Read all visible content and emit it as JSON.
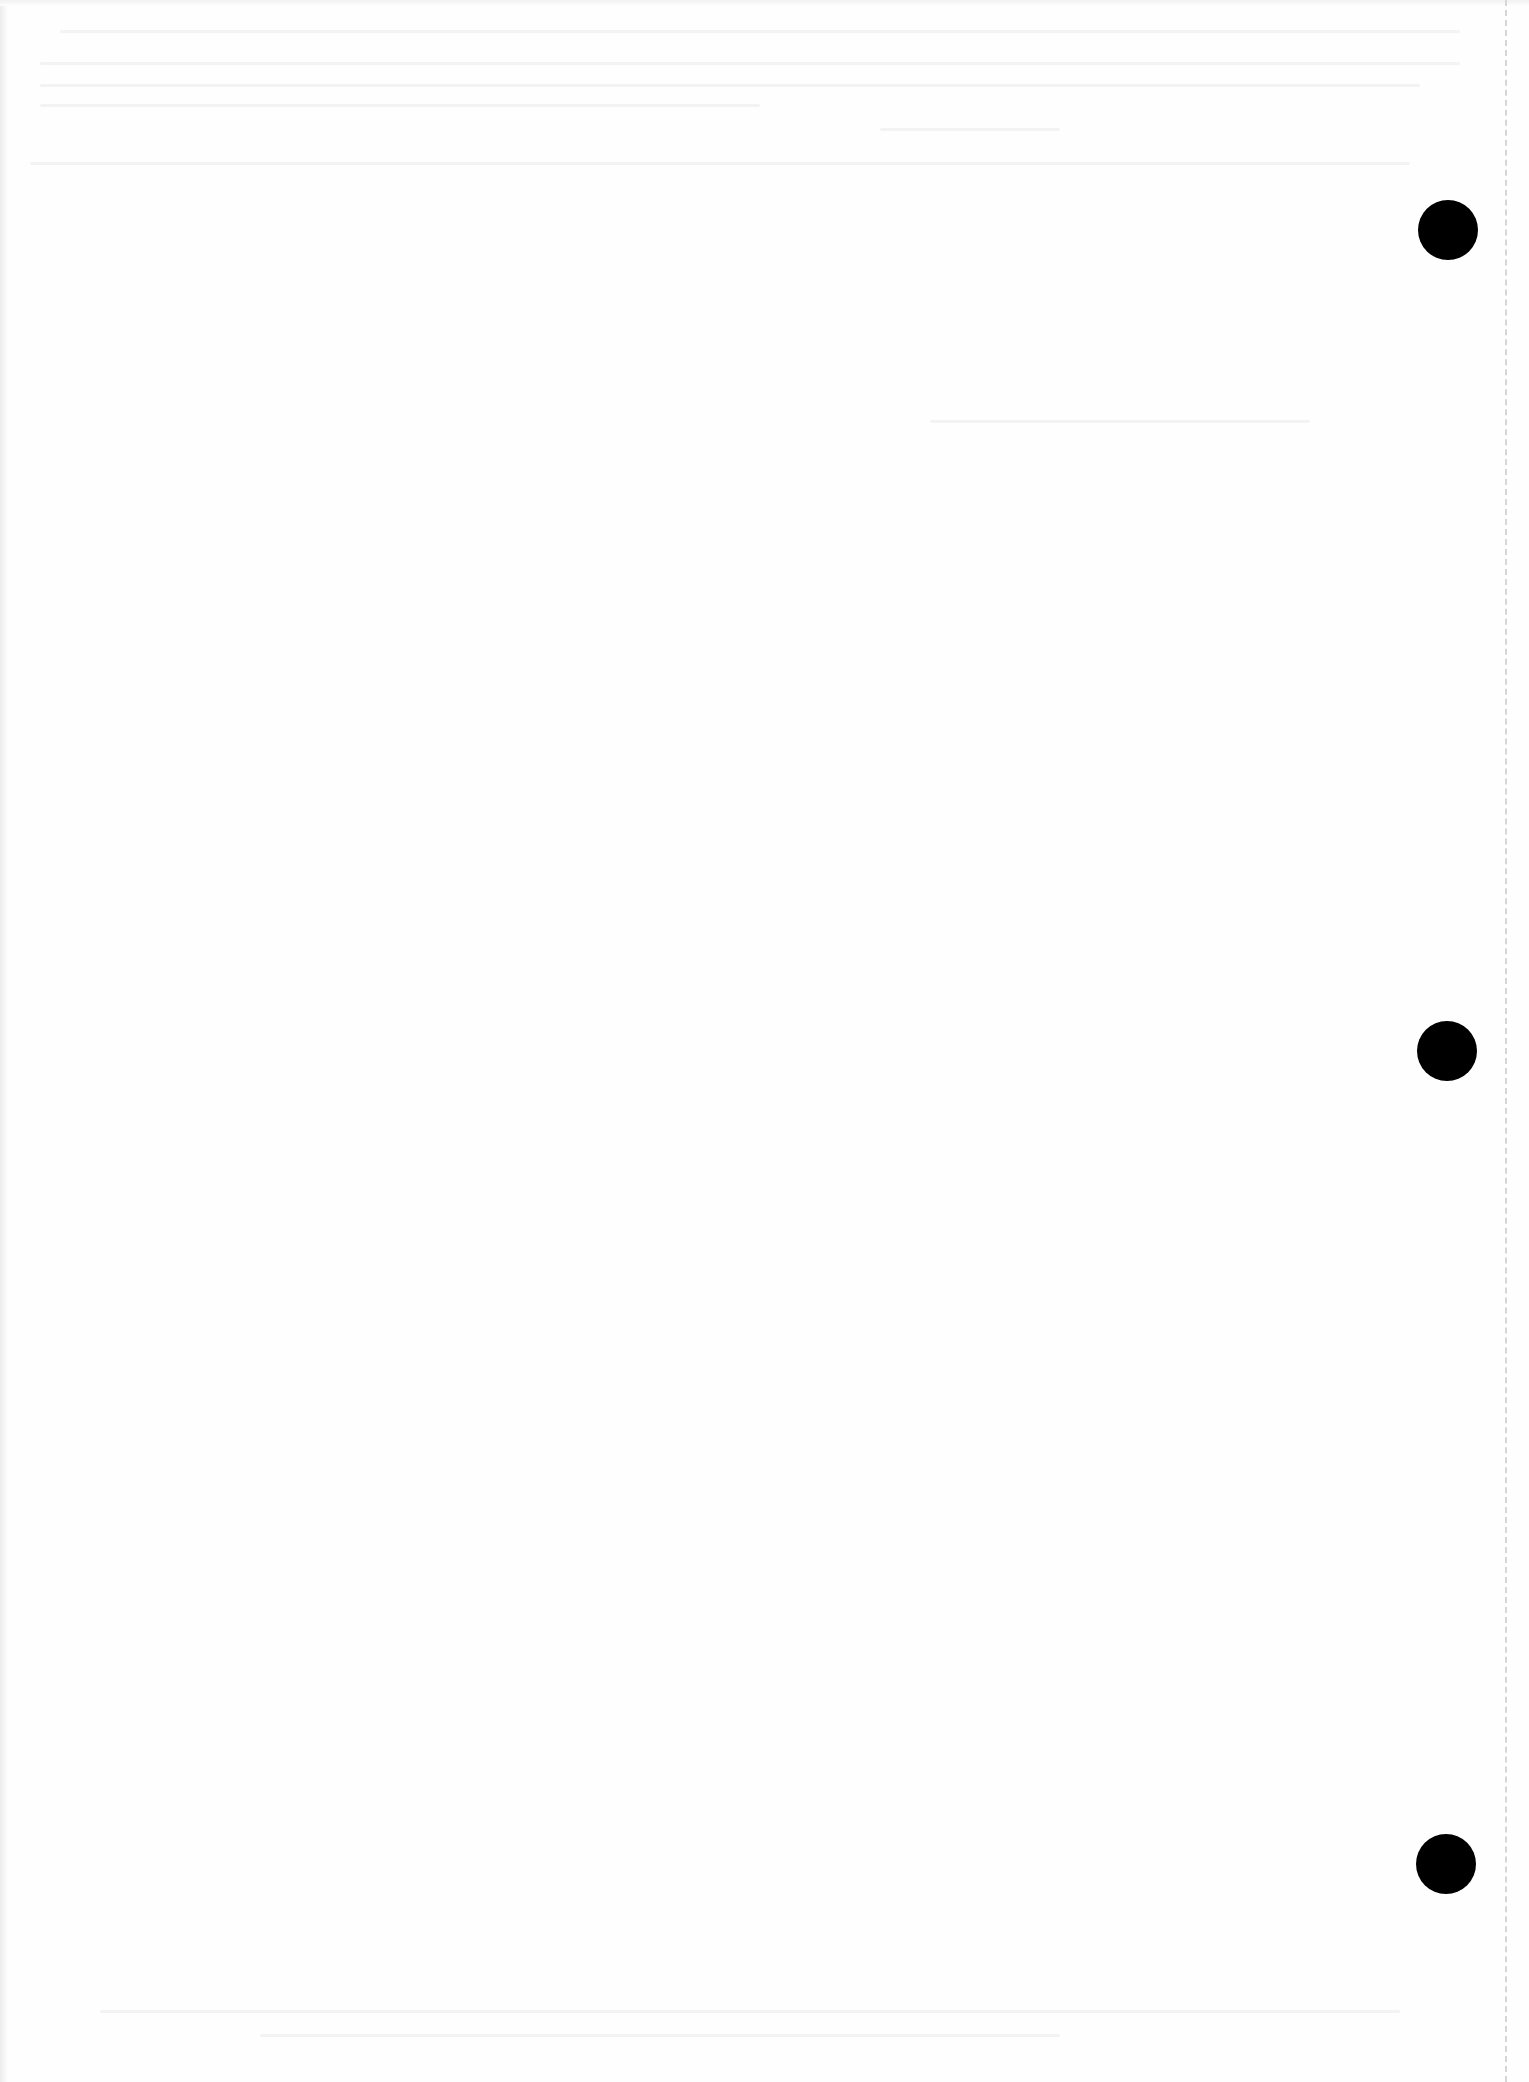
{
  "document": {
    "type": "scanned blank page",
    "background_color": "#fefefe",
    "punch_holes": [
      {
        "cx": 1448,
        "cy": 230
      },
      {
        "cx": 1447,
        "cy": 1051
      },
      {
        "cx": 1446,
        "cy": 1864
      }
    ],
    "punch_hole_color": "#000000",
    "perforation_line": {
      "x": 1506,
      "style": "dashed",
      "color": "#d6d6d6"
    },
    "bleed_through_text": "illegible"
  }
}
